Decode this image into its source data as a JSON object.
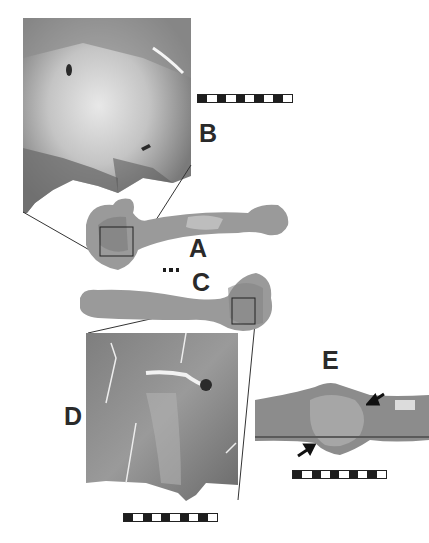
{
  "figure": {
    "panels": [
      {
        "id": "A",
        "label": "A",
        "description": "whole bone, proximal end left, with inset box"
      },
      {
        "id": "B",
        "label": "B",
        "description": "magnified view of boxed region in A"
      },
      {
        "id": "C",
        "label": "C",
        "description": "whole bone, proximal end right, with inset box"
      },
      {
        "id": "D",
        "label": "D",
        "description": "magnified view of boxed region in C"
      },
      {
        "id": "E",
        "label": "E",
        "description": "close-up of lesion with two arrows"
      }
    ],
    "scalebars": {
      "B": {
        "segments": 10
      },
      "C": {
        "segments": 6
      },
      "D": {
        "segments": 10
      },
      "E": {
        "segments": 10
      }
    },
    "colors": {
      "background": "#ffffff",
      "bone_tone": "#8a8a8a",
      "label": "#2a2a2a"
    }
  }
}
